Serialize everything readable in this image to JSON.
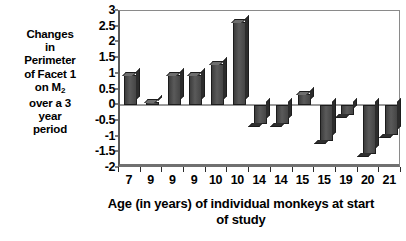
{
  "chart_data": {
    "type": "bar",
    "title": "",
    "xlabel": "Age (in years) of individual monkeys at start of study",
    "ylabel": "Changes in Perimeter of Facet 1 on M2 over a 3 year period",
    "categories": [
      "7",
      "9",
      "9",
      "9",
      "10",
      "10",
      "14",
      "14",
      "15",
      "15",
      "19",
      "20",
      "21"
    ],
    "values": [
      0.95,
      0.1,
      0.95,
      0.95,
      1.3,
      2.65,
      -0.6,
      -0.6,
      0.35,
      -1.15,
      -0.3,
      -1.55,
      -0.95
    ],
    "ylim": [
      -2,
      3
    ],
    "ytick_labels": [
      "3",
      "2.5",
      "2",
      "1.5",
      "1",
      "0.5",
      "0",
      "-0.5",
      "-1",
      "-1.5",
      "-2"
    ],
    "ytick_values": [
      3,
      2.5,
      2,
      1.5,
      1,
      0.5,
      0,
      -0.5,
      -1,
      -1.5,
      -2
    ],
    "grid": false,
    "legend": "none",
    "bar_color": "#4a4a4a",
    "axis_color": "#000000"
  },
  "ylabel_lines": [
    "Changes",
    "in",
    "Perimeter",
    "of Facet 1",
    "on M",
    "over a 3",
    "year",
    "period"
  ],
  "ylabel_subscript": "2",
  "xtitle_lines": [
    "Age (in years) of individual monkeys at start",
    "of study"
  ]
}
